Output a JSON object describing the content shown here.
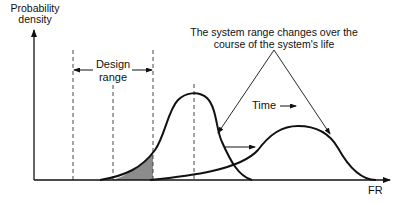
{
  "diagram": {
    "y_axis_label_line1": "Probability",
    "y_axis_label_line2": "density",
    "x_axis_label": "FR",
    "design_range_line1": "Design",
    "design_range_line2": "range",
    "annotation_line1": "The system range changes over the",
    "annotation_line2": "course of the system's life",
    "time_label": "Time",
    "colors": {
      "line": "#111111",
      "shaded": "#8c8c8c",
      "dashed": "#333333"
    }
  }
}
